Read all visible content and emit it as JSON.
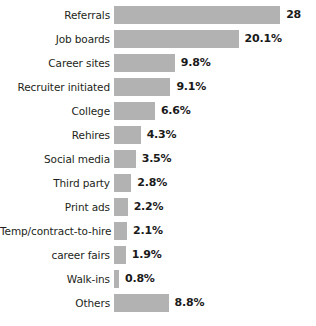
{
  "chart_data": {
    "type": "bar",
    "orientation": "horizontal",
    "title": "",
    "subtitle": "",
    "xlabel": "",
    "ylabel": "",
    "grid": false,
    "legend": null,
    "axis_visible": false,
    "value_suffix": "%",
    "xlim": [
      0,
      28
    ],
    "bar_color": "#b2b2b2",
    "label_color": "#231f20",
    "value_color": "#1a1a1a",
    "background": "#ffffff",
    "categories": [
      "Referrals",
      "Job boards",
      "Career sites",
      "Recruiter initiated",
      "College",
      "Rehires",
      "Social media",
      "Third party",
      "Print ads",
      "Temp/contract-to-hire",
      "career fairs",
      "Walk-ins",
      "Others"
    ],
    "values": [
      26.8,
      20.1,
      9.8,
      9.1,
      6.6,
      4.3,
      3.5,
      2.8,
      2.2,
      2.1,
      1.9,
      0.8,
      8.8
    ],
    "value_labels": [
      "28",
      "20.1%",
      "9.8%",
      "9.1%",
      "6.6%",
      "4.3%",
      "3.5%",
      "2.8%",
      "2.2%",
      "2.1%",
      "1.9%",
      "0.8%",
      "8.8%"
    ]
  }
}
